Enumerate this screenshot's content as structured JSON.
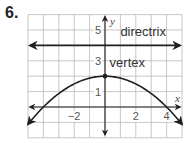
{
  "problem": {
    "number": "6."
  },
  "chart_data": {
    "type": "line",
    "title": "",
    "xlabel": "x",
    "ylabel": "y",
    "xlim": [
      -5,
      5
    ],
    "ylim": [
      -2,
      6
    ],
    "grid": true,
    "x_ticks": [
      {
        "value": -2,
        "label": "−2"
      },
      {
        "value": 2,
        "label": "2"
      },
      {
        "value": 4,
        "label": "4"
      }
    ],
    "y_ticks": [
      {
        "value": 1,
        "label": "1"
      },
      {
        "value": 3,
        "label": "3"
      },
      {
        "value": 5,
        "label": "5"
      }
    ],
    "series": [
      {
        "name": "parabola",
        "equation": "y = -x^2/8 + 2",
        "x": [
          -5,
          -4,
          -3,
          -2,
          -1,
          0,
          1,
          2,
          3,
          4,
          5
        ],
        "y": [
          -1.125,
          0,
          0.875,
          1.5,
          1.875,
          2,
          1.875,
          1.5,
          0.875,
          0,
          -1.125
        ]
      },
      {
        "name": "directrix",
        "equation": "y = 4",
        "x": [
          -5,
          5
        ],
        "y": [
          4,
          4
        ]
      }
    ],
    "points": [
      {
        "name": "vertex",
        "x": 0,
        "y": 2
      }
    ],
    "annotations": [
      {
        "text": "directrix",
        "x": 1,
        "y": 4.6
      },
      {
        "text": "vertex",
        "x": 0.3,
        "y": 2.6
      }
    ]
  },
  "colors": {
    "grid": "#b9b9b9",
    "curve": "#231f20",
    "axis": "#231f20"
  }
}
